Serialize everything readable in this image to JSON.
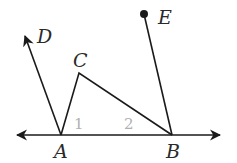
{
  "diagram": {
    "type": "geometry",
    "points": {
      "A": {
        "label": "A",
        "x": 61,
        "y": 135
      },
      "B": {
        "label": "B",
        "x": 172,
        "y": 135
      },
      "C": {
        "label": "C",
        "x": 79,
        "y": 73
      },
      "D": {
        "label": "D",
        "x": 24,
        "y": 34
      },
      "E": {
        "label": "E",
        "x": 144,
        "y": 14
      }
    },
    "angle_labels": {
      "angle1": "1",
      "angle2": "2"
    },
    "segments": [
      "AB (line with arrows both ends)",
      "AC",
      "CB",
      "BE",
      "AD (ray)"
    ],
    "colors": {
      "stroke": "#1a1a1a",
      "angle_label": "#b0b0b0"
    }
  }
}
